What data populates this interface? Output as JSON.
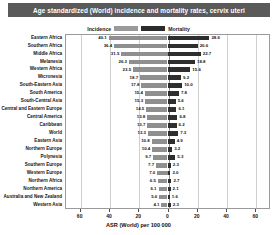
{
  "title": "Age standardized (World) incidence and mortality rates, cervix uteri",
  "legend": {
    "incidence_label": "Incidence",
    "mortality_label": "Mortality",
    "incidence_color": "#8f8f8f",
    "mortality_color": "#2e2e2e",
    "position": "top-center"
  },
  "axis": {
    "xlabel": "ASR (World) per 100 000",
    "ticks": [
      "60",
      "40",
      "20",
      "0",
      "20",
      "40",
      "60"
    ],
    "tick_values": [
      -60,
      -40,
      -20,
      0,
      20,
      40,
      60
    ],
    "xmin": -70,
    "xmax": 70,
    "grid": true
  },
  "chart_data": {
    "type": "bar",
    "orientation": "horizontal-diverging",
    "title": "Age standardized (World) incidence and mortality rates, cervix uteri",
    "xlabel": "ASR (World) per 100 000",
    "ylabel": "",
    "xlim": [
      -70,
      70
    ],
    "grid": true,
    "legend_position": "top-center",
    "categories": [
      "Eastern Africa",
      "Southern Africa",
      "Middle Africa",
      "Melanesia",
      "Western Africa",
      "Micronesia",
      "South-Eastern Asia",
      "South America",
      "South-Central Asia",
      "Central and Eastern Europe",
      "Central America",
      "Caribbean",
      "World",
      "Eastern Asia",
      "Northern Europe",
      "Polynesia",
      "Southern Europe",
      "Western Europe",
      "Northern Africa",
      "Northern America",
      "Australia and New Zealand",
      "Western Asia"
    ],
    "series": [
      {
        "name": "Incidence",
        "color": "#8f8f8f",
        "side": "left",
        "values": [
          40.1,
          36.4,
          31.5,
          26.3,
          23.5,
          18.7,
          17.8,
          15.4,
          15.3,
          14.5,
          13.8,
          13.7,
          13.3,
          10.8,
          10.4,
          9.7,
          7.7,
          7.0,
          6.5,
          6.1,
          5.6,
          4.1
        ]
      },
      {
        "name": "Mortality",
        "color": "#2e2e2e",
        "side": "right",
        "values": [
          28.6,
          20.6,
          22.7,
          18.8,
          15.6,
          9.2,
          10.0,
          7.8,
          5.6,
          6.1,
          6.8,
          6.2,
          7.3,
          4.9,
          3.2,
          5.3,
          2.3,
          2.0,
          2.7,
          2.1,
          1.6,
          2.3
        ]
      }
    ]
  }
}
